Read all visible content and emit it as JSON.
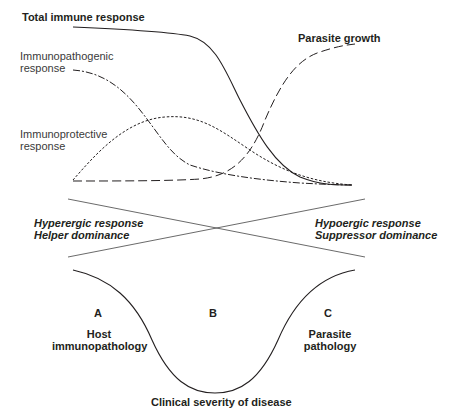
{
  "diagram": {
    "top_panel": {
      "curves": [
        {
          "id": "total",
          "label": "Total immune response",
          "style": "solid"
        },
        {
          "id": "immunopathogenic",
          "label_lines": [
            "Immunopathogenic",
            "response"
          ],
          "style": "long-short dash"
        },
        {
          "id": "immunoprotective",
          "label_lines": [
            "Immunoprotective",
            "response"
          ],
          "style": "dotted"
        },
        {
          "id": "parasite",
          "label": "Parasite growth",
          "style": "long dash"
        }
      ]
    },
    "middle_panel": {
      "left": {
        "line1": "Hyperergic response",
        "line2": "Helper dominance"
      },
      "right": {
        "line1": "Hypoergic response",
        "line2": "Suppressor dominance"
      }
    },
    "bottom_panel": {
      "regions": [
        {
          "letter": "A",
          "line1": "Host",
          "line2": "immunopathology"
        },
        {
          "letter": "B"
        },
        {
          "letter": "C",
          "line1": "Parasite",
          "line2": "pathology"
        }
      ],
      "axis_label": "Clinical severity of disease"
    },
    "colors": {
      "ink": "#231f20",
      "background": "#ffffff"
    }
  }
}
